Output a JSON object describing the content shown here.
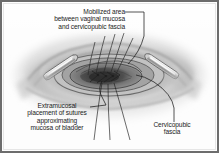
{
  "figure": {
    "style": "grayscale medical line-and-wash illustration",
    "frame_color": "#6d6d6d",
    "background_color": "#fdfdfd",
    "text_color": "#1b1b1b"
  },
  "labels": {
    "mobilized": {
      "name": "mobilized-area-label",
      "line1": "Mobilized area",
      "line2": "between vaginal mucosa",
      "line3": "and cervicopubic fascia"
    },
    "extramucosal": {
      "name": "extramucosal-sutures-label",
      "line1": "Extramucosal",
      "line2": "placement of sutures",
      "line3": "approximating",
      "line4": "mucosa of bladder"
    },
    "cervicopubic": {
      "name": "cervicopubic-fascia-label",
      "line1": "Cervicopubic",
      "line2": "fascia"
    }
  },
  "anatomy": {
    "structures": [
      "vaginal mucosa",
      "cervicopubic fascia",
      "mucosa of bladder",
      "surgical retractor left",
      "surgical retractor right",
      "extramucosal sutures"
    ]
  }
}
